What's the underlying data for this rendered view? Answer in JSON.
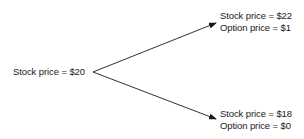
{
  "diagram": {
    "type": "binomial-tree",
    "root": {
      "stock_label": "Stock price = $20"
    },
    "up_state": {
      "stock_label": "Stock price = $22",
      "option_label": "Option price = $1"
    },
    "down_state": {
      "stock_label": "Stock price = $18",
      "option_label": "Option price = $0"
    },
    "colors": {
      "ink": "#1a1a1a",
      "background": "#ffffff"
    }
  }
}
